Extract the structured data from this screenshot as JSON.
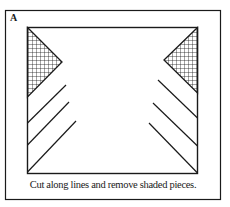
{
  "figure": {
    "panel_label": "A",
    "caption": "Cut along lines and remove shaded pieces.",
    "colors": {
      "stroke": "#1a1a1a",
      "background": "#ffffff"
    },
    "elements": {
      "outer_frame": "rectangle border",
      "inner_square": "square to be cut",
      "shaded_pieces": [
        "left triangle (crosshatched)",
        "right triangle (crosshatched)"
      ],
      "cut_lines_left": 3,
      "cut_lines_right": 3
    }
  }
}
